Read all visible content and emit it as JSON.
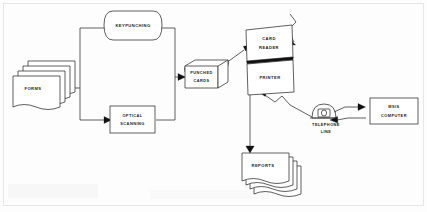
{
  "diagram": {
    "nodes": [
      {
        "id": "forms",
        "label": "FORMS",
        "shape": "document-stack",
        "x": 40,
        "y": 88
      },
      {
        "id": "keypunching",
        "label": "KEYPUNCHING",
        "shape": "rounded-capsule",
        "x": 133,
        "y": 25
      },
      {
        "id": "optical",
        "label_line1": "OPTICAL",
        "label_line2": "SCANNING",
        "shape": "rectangle",
        "x": 131,
        "y": 119
      },
      {
        "id": "punchedcards",
        "label_line1": "PUNCHED",
        "label_line2": "CARDS",
        "shape": "card-deck",
        "x": 197,
        "y": 74
      },
      {
        "id": "cardreader",
        "label_line1": "CARD",
        "label_line2": "READER",
        "shape": "skewed-panel-top",
        "x": 266,
        "y": 43
      },
      {
        "id": "printer",
        "label": "PRINTER",
        "shape": "skewed-panel-bottom",
        "x": 265,
        "y": 77
      },
      {
        "id": "telephone",
        "label_line1": "TELEPHONE",
        "label_line2": "LINE",
        "shape": "telephone",
        "x": 326,
        "y": 116
      },
      {
        "id": "computer",
        "label_line1": "MSIS",
        "label_line2": "COMPUTER",
        "shape": "rectangle",
        "x": 394,
        "y": 111
      },
      {
        "id": "reports",
        "label": "REPORTS",
        "shape": "document-stack",
        "x": 262,
        "y": 166
      }
    ],
    "edges": [
      {
        "from": "forms",
        "to": "keypunching",
        "style": "orthogonal",
        "arrow": "single"
      },
      {
        "from": "forms",
        "to": "optical",
        "style": "orthogonal",
        "arrow": "single"
      },
      {
        "from": "keypunching",
        "to": "punchedcards",
        "style": "orthogonal",
        "arrow": "single"
      },
      {
        "from": "optical",
        "to": "punchedcards",
        "style": "orthogonal",
        "arrow": "single"
      },
      {
        "from": "punchedcards",
        "to": "cardreader",
        "style": "straight",
        "arrow": "single"
      },
      {
        "from": "cardreader",
        "to": "telephone",
        "style": "zigzag",
        "arrow": "single"
      },
      {
        "from": "telephone",
        "to": "printer",
        "style": "zigzag",
        "arrow": "single"
      },
      {
        "from": "telephone",
        "to": "computer",
        "style": "straight",
        "arrow": "double"
      },
      {
        "from": "printer",
        "to": "reports",
        "style": "orthogonal",
        "arrow": "single"
      }
    ]
  }
}
